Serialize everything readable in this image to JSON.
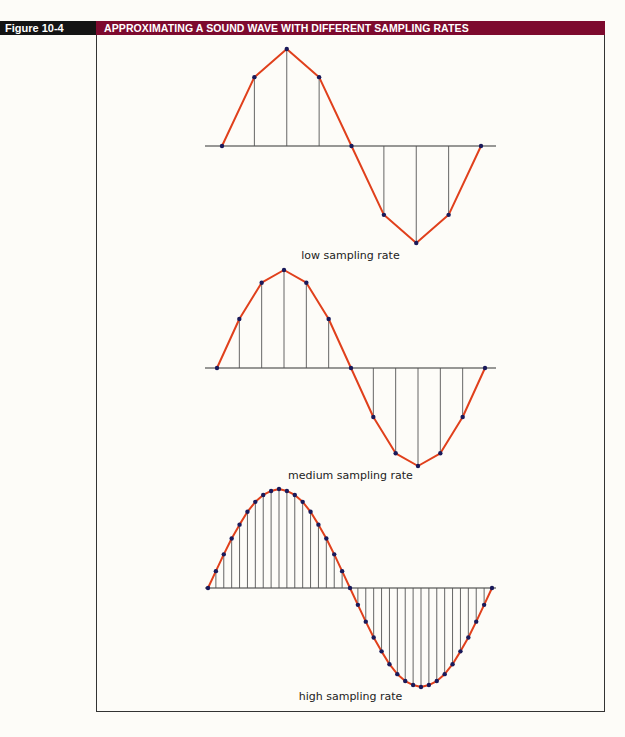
{
  "figure": {
    "label": "Figure 10-4",
    "title": "APPROXIMATING A SOUND WAVE WITH DIFFERENT SAMPLING RATES",
    "colors": {
      "label_bg": "#141414",
      "title_bg": "#7d0a2e",
      "wave": "#e0401c",
      "sample_dot": "#1a1a5a",
      "stem": "#555555",
      "axis": "#333333"
    }
  },
  "chart_data": [
    {
      "type": "line",
      "title": "low sampling rate",
      "samples_per_cycle": 8,
      "x": [
        0,
        1,
        2,
        3,
        4,
        5,
        6,
        7,
        8
      ],
      "values": [
        0,
        0.71,
        1,
        0.71,
        0,
        -0.71,
        -1,
        -0.71,
        0
      ],
      "ylim": [
        -1,
        1
      ],
      "grid": false
    },
    {
      "type": "line",
      "title": "medium sampling rate",
      "samples_per_cycle": 12,
      "x": [
        0,
        1,
        2,
        3,
        4,
        5,
        6,
        7,
        8,
        9,
        10,
        11,
        12
      ],
      "values": [
        0,
        0.5,
        0.87,
        1,
        0.87,
        0.5,
        0,
        -0.5,
        -0.87,
        -1,
        -0.87,
        -0.5,
        0
      ],
      "ylim": [
        -1,
        1
      ],
      "grid": false
    },
    {
      "type": "line",
      "title": "high sampling rate",
      "samples_per_cycle": 36,
      "x": [
        0,
        1,
        2,
        3,
        4,
        5,
        6,
        7,
        8,
        9,
        10,
        11,
        12,
        13,
        14,
        15,
        16,
        17,
        18,
        19,
        20,
        21,
        22,
        23,
        24,
        25,
        26,
        27,
        28,
        29,
        30,
        31,
        32,
        33,
        34,
        35,
        36
      ],
      "values": [
        0,
        0.17,
        0.34,
        0.5,
        0.64,
        0.77,
        0.87,
        0.94,
        0.98,
        1,
        0.98,
        0.94,
        0.87,
        0.77,
        0.64,
        0.5,
        0.34,
        0.17,
        0,
        -0.17,
        -0.34,
        -0.5,
        -0.64,
        -0.77,
        -0.87,
        -0.94,
        -0.98,
        -1,
        -0.98,
        -0.94,
        -0.87,
        -0.77,
        -0.64,
        -0.5,
        -0.34,
        -0.17,
        0
      ],
      "ylim": [
        -1,
        1
      ],
      "grid": false
    }
  ],
  "panels": [
    {
      "caption": "low sampling rate",
      "x0": 222,
      "x1": 481,
      "axis_y": 146,
      "amp": 97,
      "axis_x0": 205,
      "axis_x1": 496,
      "caption_y": 249
    },
    {
      "caption": "medium sampling rate",
      "x0": 217,
      "x1": 485,
      "axis_y": 368,
      "amp": 98,
      "axis_x0": 205,
      "axis_x1": 496,
      "caption_y": 469
    },
    {
      "caption": "high sampling rate",
      "x0": 208,
      "x1": 492,
      "axis_y": 588,
      "amp": 99,
      "axis_x0": 205,
      "axis_x1": 496,
      "caption_y": 690
    }
  ]
}
